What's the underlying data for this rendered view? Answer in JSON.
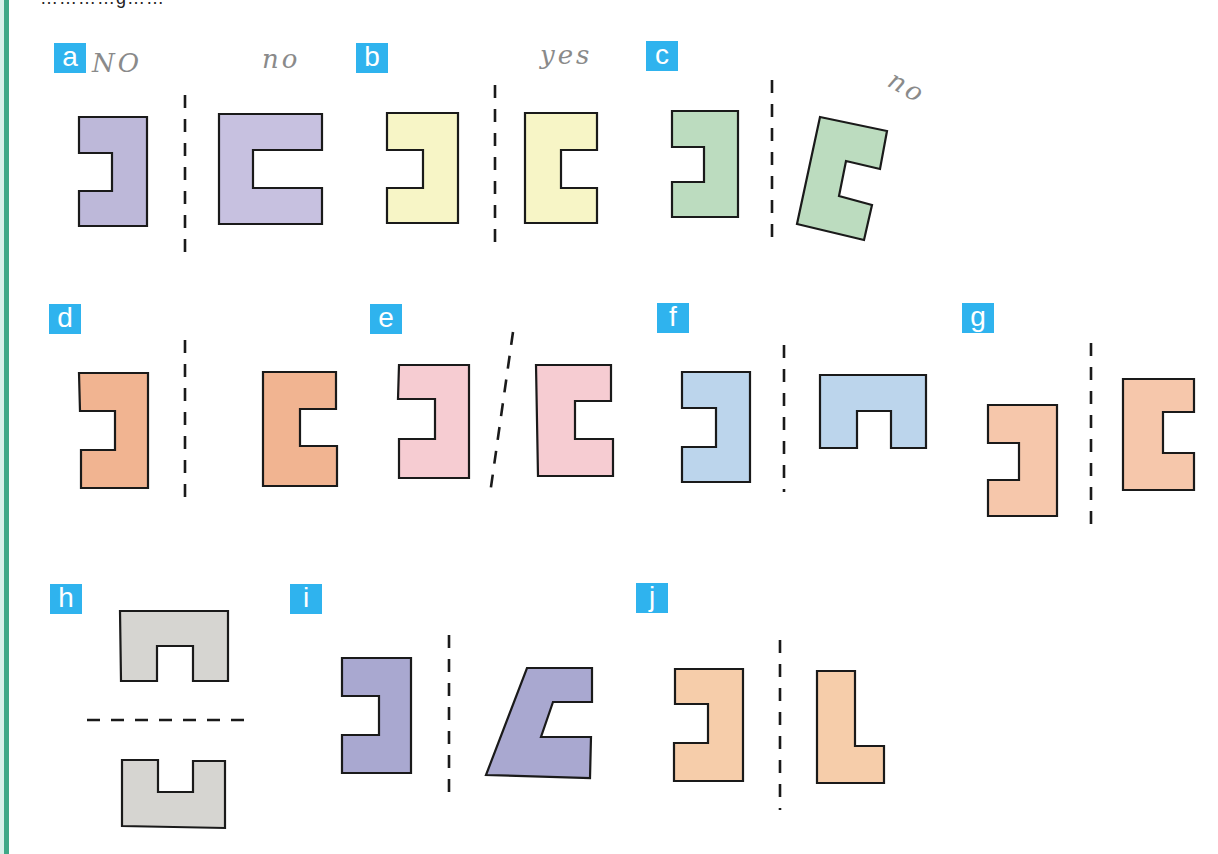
{
  "page": {
    "top_clipped_text": "…………g……",
    "border_color": "#3fa887"
  },
  "badge_color": "#2fb3ee",
  "panels": [
    {
      "label": "a",
      "annotations": [
        "NO",
        "no"
      ],
      "fill": "#bdb8d9",
      "axis": "vertical",
      "description": "Left: reversed C shape; right: larger C shape; dashed vertical line between"
    },
    {
      "label": "b",
      "annotations": [
        "yes"
      ],
      "fill": "#f7f5c6",
      "axis": "vertical",
      "description": "Reversed C and mirrored C, equal size, dashed vertical line between"
    },
    {
      "label": "c",
      "annotations": [
        "no"
      ],
      "fill": "#bcdcbf",
      "axis": "vertical",
      "description": "Reversed C and rotated C shape, dashed vertical line between"
    },
    {
      "label": "d",
      "annotations": [],
      "fill": "#f1b491",
      "axis": "vertical",
      "description": "Reversed C and C shifted farther from the line"
    },
    {
      "label": "e",
      "annotations": [],
      "fill": "#f6ccd2",
      "axis": "slanted",
      "description": "Reversed C and C with slanted dashed line"
    },
    {
      "label": "f",
      "annotations": [],
      "fill": "#bcd5ec",
      "axis": "vertical",
      "description": "Reversed C and arch (upside-down U) shape"
    },
    {
      "label": "g",
      "annotations": [],
      "fill": "#f6c7ab",
      "axis": "vertical",
      "description": "Reversed C lower and C higher, vertical dashed line"
    },
    {
      "label": "h",
      "annotations": [],
      "fill": "#d6d5d1",
      "axis": "horizontal",
      "description": "Arch shape above, U shape below, horizontal dashed line"
    },
    {
      "label": "i",
      "annotations": [],
      "fill": "#a9a8d0",
      "axis": "vertical",
      "description": "Reversed C and skewed C shape"
    },
    {
      "label": "j",
      "annotations": [],
      "fill": "#f6cdaa",
      "axis": "vertical",
      "description": "Reversed C and L shape"
    }
  ]
}
